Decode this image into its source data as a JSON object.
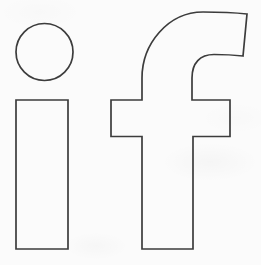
{
  "artwork": {
    "title": "if",
    "description": "Line-art outline drawing of the lowercase letters i and f",
    "background_color": "#fbfbfb",
    "stroke_color": "#3c3c3c",
    "fill_color": "#fbfbfb",
    "stroke_width": 1.7,
    "canvas": {
      "width": 261,
      "height": 265
    }
  },
  "letters": [
    {
      "character": "i",
      "name": "letter-i",
      "parts": [
        {
          "name": "i-dot",
          "shape": "circle",
          "cx": 44.5,
          "cy": 52.0,
          "r": 28.5
        },
        {
          "name": "i-stem",
          "shape": "rect",
          "x": 16,
          "y": 100,
          "width": 52,
          "height": 149,
          "path": "M16,100 L68,100 L68,249 L16,249 Z"
        }
      ]
    },
    {
      "character": "f",
      "name": "letter-f",
      "parts": [
        {
          "name": "f-body",
          "shape": "path",
          "path": "M142,249 L142,136.5 L111,136.5 L111,100 L142,100 L142,78 C142,44 168,12 203,12 C222,12 238,13 247,14 L243,56 C234,55 224,54.5 214,54.5 C200,54.5 192,63 192,78 L192,100 L230,100 L230,136.5 L193,136.5 L193,249 Z"
        }
      ]
    }
  ]
}
